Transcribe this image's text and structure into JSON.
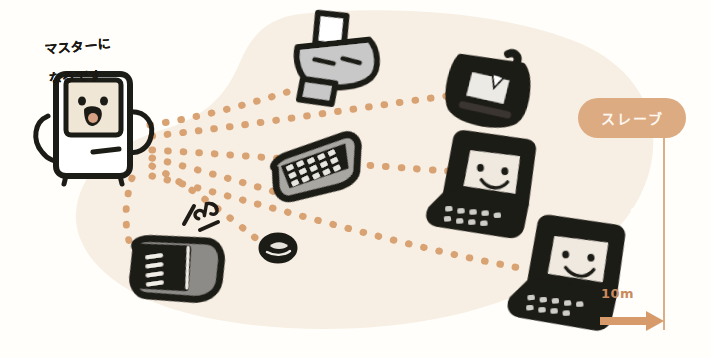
{
  "illustration": {
    "title": "Bluetooth master-slave wireless range diagram",
    "background_color": "#fffefb",
    "range_blob_color": "#f7efe3",
    "link_dot_color": "#d9a273",
    "ink_color": "#1f1b17",
    "device_body_color": "#b0b0b0",
    "screen_color": "#f0e9de"
  },
  "caption": {
    "line1": "マスターに",
    "line2": "なるです"
  },
  "slave_label": {
    "text": "スレーブ",
    "pill_color": "#ddab82",
    "text_color": "#fdf7f0"
  },
  "scale": {
    "label": "10m",
    "color": "#c98a5c"
  },
  "master": {
    "name": "マスター",
    "device_type": "desktop-computer",
    "has_face": true,
    "expression": "smiling-open-mouth"
  },
  "slaves": [
    {
      "id": "printer",
      "device_type": "printer",
      "has_face": false,
      "x": 330,
      "y": 60
    },
    {
      "id": "handheld",
      "device_type": "handheld-pda",
      "has_face": false,
      "x": 494,
      "y": 78
    },
    {
      "id": "laptop-middle",
      "device_type": "laptop",
      "has_face": true,
      "x": 470,
      "y": 175
    },
    {
      "id": "keyboard",
      "device_type": "keyboard",
      "has_face": false,
      "x": 305,
      "y": 196
    },
    {
      "id": "mouse",
      "device_type": "mouse",
      "has_face": false,
      "x": 277,
      "y": 248
    },
    {
      "id": "laptop-bottom",
      "device_type": "laptop",
      "has_face": true,
      "x": 556,
      "y": 265
    },
    {
      "id": "mobile-phone",
      "device_type": "mobile-phone",
      "has_face": false,
      "x": 163,
      "y": 265
    }
  ],
  "links": [
    {
      "from": "master",
      "to": "printer"
    },
    {
      "from": "master",
      "to": "handheld"
    },
    {
      "from": "master",
      "to": "laptop-middle"
    },
    {
      "from": "master",
      "to": "keyboard"
    },
    {
      "from": "master",
      "to": "mouse"
    },
    {
      "from": "master",
      "to": "laptop-bottom"
    },
    {
      "from": "master",
      "to": "mobile-phone"
    }
  ],
  "annotations": {
    "music_note": "♪"
  }
}
